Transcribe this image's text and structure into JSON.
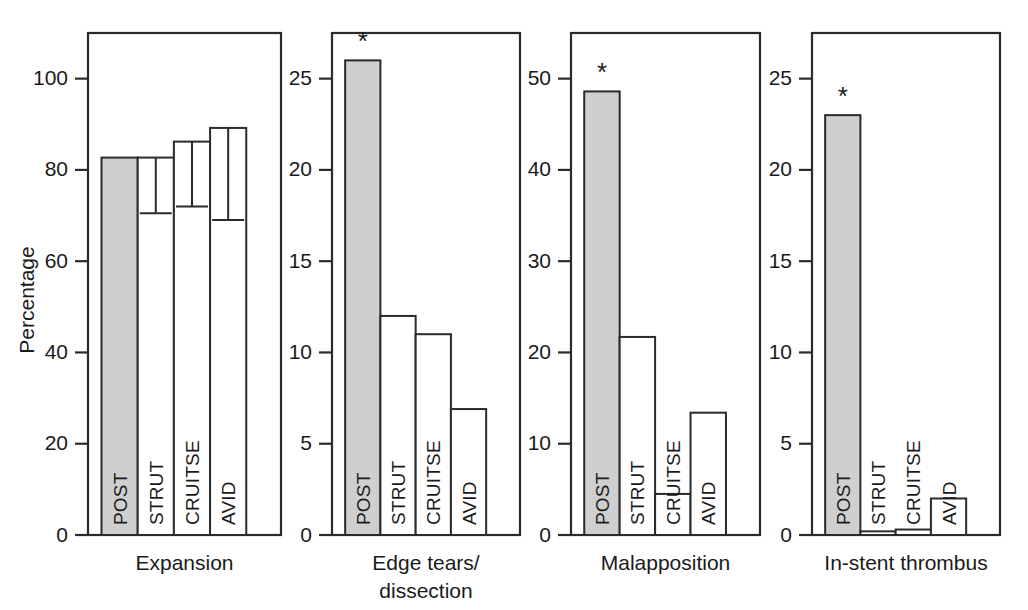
{
  "figure": {
    "background_color": "#ffffff",
    "ink_color": "#2b2b2b",
    "shaded_bar_color": "#cfcfcf",
    "open_bar_color": "#ffffff",
    "y_axis_title": "Percentage",
    "significance_marker": "*"
  },
  "chart_data": [
    {
      "type": "bar",
      "title": "Expansion",
      "xlabel": "",
      "ylabel": "Percentage",
      "ylim": [
        0,
        110
      ],
      "yticks": [
        0,
        20,
        40,
        60,
        80,
        100
      ],
      "ytick_labels": [
        "0",
        "20",
        "40",
        "60",
        "80",
        "100"
      ],
      "grid": false,
      "legend": "none",
      "categories": [
        "POST",
        "STRUT",
        "CRUITSE",
        "AVID"
      ],
      "values": [
        82.7,
        82.7,
        86.2,
        89.2
      ],
      "error_low": [
        null,
        70.5,
        72.0,
        69.0
      ],
      "bar_fill": [
        "shaded",
        "open",
        "open",
        "open"
      ],
      "significant": [
        false,
        false,
        false,
        false
      ],
      "annotations": []
    },
    {
      "type": "bar",
      "title": "Edge tears/ dissection",
      "title_lines": [
        "Edge tears/",
        "dissection"
      ],
      "xlabel": "",
      "ylabel": "",
      "ylim": [
        0,
        27.5
      ],
      "yticks": [
        0,
        5,
        10,
        15,
        20,
        25
      ],
      "ytick_labels": [
        "0",
        "5",
        "10",
        "15",
        "20",
        "25"
      ],
      "grid": false,
      "legend": "none",
      "categories": [
        "POST",
        "STRUT",
        "CRUITSE",
        "AVID"
      ],
      "values": [
        26.0,
        12.0,
        11.0,
        6.9
      ],
      "error_low": [
        null,
        null,
        null,
        null
      ],
      "bar_fill": [
        "shaded",
        "open",
        "open",
        "open"
      ],
      "significant": [
        true,
        false,
        false,
        false
      ],
      "annotations": [
        {
          "category": "POST",
          "text": "*"
        }
      ]
    },
    {
      "type": "bar",
      "title": "Malapposition",
      "xlabel": "",
      "ylabel": "",
      "ylim": [
        0,
        55
      ],
      "yticks": [
        0,
        10,
        20,
        30,
        40,
        50
      ],
      "ytick_labels": [
        "0",
        "10",
        "20",
        "30",
        "40",
        "50"
      ],
      "grid": false,
      "legend": "none",
      "categories": [
        "POST",
        "STRUT",
        "CRUITSE",
        "AVID"
      ],
      "values": [
        48.6,
        21.7,
        4.5,
        13.4
      ],
      "error_low": [
        null,
        null,
        null,
        null
      ],
      "bar_fill": [
        "shaded",
        "open",
        "open",
        "open"
      ],
      "significant": [
        true,
        false,
        false,
        false
      ],
      "annotations": [
        {
          "category": "POST",
          "text": "*"
        }
      ]
    },
    {
      "type": "bar",
      "title": "In-stent thrombus",
      "xlabel": "",
      "ylabel": "",
      "ylim": [
        0,
        27.5
      ],
      "yticks": [
        0,
        5,
        10,
        15,
        20,
        25
      ],
      "ytick_labels": [
        "0",
        "5",
        "10",
        "15",
        "20",
        "25"
      ],
      "grid": false,
      "legend": "none",
      "categories": [
        "POST",
        "STRUT",
        "CRUITSE",
        "AVID"
      ],
      "values": [
        23.0,
        0.2,
        0.3,
        2.0
      ],
      "error_low": [
        null,
        null,
        null,
        null
      ],
      "bar_fill": [
        "shaded",
        "open",
        "open",
        "open"
      ],
      "significant": [
        true,
        false,
        false,
        false
      ],
      "annotations": [
        {
          "category": "POST",
          "text": "*"
        }
      ]
    }
  ]
}
